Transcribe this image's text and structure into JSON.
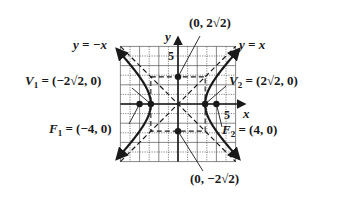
{
  "figure": {
    "type": "hyperbola-graph",
    "equation_implied": "x^2/8 - y^2/8 = 1",
    "axes": {
      "x_label": "x",
      "y_label": "y",
      "x_tick": "5",
      "y_tick": "5"
    },
    "grid": {
      "xmin": -6,
      "xmax": 6,
      "ymin": -6,
      "ymax": 6,
      "step": 1
    },
    "asymptotes": [
      {
        "label": "y = x",
        "slope": 1
      },
      {
        "label": "y = −x",
        "slope": -1
      }
    ],
    "points": {
      "V1": {
        "label": "V",
        "sub": "1",
        "value": " = (−2√2, 0)",
        "x": -2.828,
        "y": 0
      },
      "V2": {
        "label": "V",
        "sub": "2",
        "value": " = (2√2, 0)",
        "x": 2.828,
        "y": 0
      },
      "F1": {
        "label": "F",
        "sub": "1",
        "value": " = (−4, 0)",
        "x": -4,
        "y": 0
      },
      "F2": {
        "label": "F",
        "sub": "2",
        "value": " = (4, 0)",
        "x": 4,
        "y": 0
      },
      "B1": {
        "label": "(0, 2√2)",
        "x": 0,
        "y": 2.828
      },
      "B2": {
        "label": "(0, −2√2)",
        "x": 0,
        "y": -2.828
      }
    },
    "labels": {
      "y_eq_neg_x": "y = −x",
      "y_eq_x": "y = x",
      "top_point": "(0, 2√2)",
      "bottom_point": "(0, −2√2)"
    },
    "colors": {
      "ink": "#1a1a1a",
      "grid": "#555555",
      "background": "#ffffff"
    }
  }
}
